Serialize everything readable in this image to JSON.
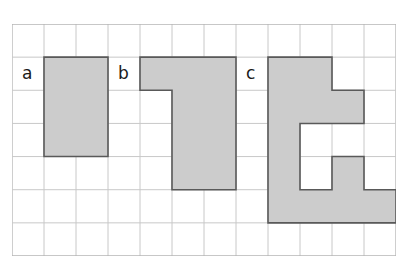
{
  "figure": {
    "type": "grid-shapes-diagram",
    "background_color": "#ffffff",
    "grid": {
      "columns": 12,
      "rows": 7,
      "cell_width": 32,
      "cell_height": 33.14,
      "origin_x": 12,
      "origin_y": 24,
      "line_color": "#c8c8c8",
      "border_color": "#b4b4b4",
      "show_grid": true
    },
    "style": {
      "shape_fill": "#cccccc",
      "shape_stroke": "#595959",
      "label_color": "#1a1a1a"
    },
    "shapes": [
      {
        "id": "shape-a",
        "label": "a",
        "label_col": 0,
        "label_row": 1,
        "cells": [
          [
            1,
            1
          ],
          [
            2,
            1
          ],
          [
            1,
            2
          ],
          [
            2,
            2
          ],
          [
            1,
            3
          ],
          [
            2,
            3
          ]
        ],
        "description": "2 by 3 rectangle, 6 squares"
      },
      {
        "id": "shape-b",
        "label": "b",
        "label_col": 3,
        "label_row": 1,
        "cells": [
          [
            4,
            1
          ],
          [
            5,
            1
          ],
          [
            6,
            1
          ],
          [
            5,
            2
          ],
          [
            6,
            2
          ],
          [
            5,
            3
          ],
          [
            6,
            3
          ],
          [
            5,
            4
          ],
          [
            6,
            4
          ]
        ],
        "description": "J shape, 9 squares"
      },
      {
        "id": "shape-c",
        "label": "c",
        "label_col": 7,
        "label_row": 1,
        "cells": [
          [
            8,
            1
          ],
          [
            9,
            1
          ],
          [
            8,
            2
          ],
          [
            9,
            2
          ],
          [
            10,
            2
          ],
          [
            8,
            3
          ],
          [
            8,
            4
          ],
          [
            10,
            4
          ],
          [
            8,
            5
          ],
          [
            9,
            5
          ],
          [
            10,
            5
          ],
          [
            11,
            5
          ]
        ],
        "description": "Irregular shape with notch, 12 squares"
      }
    ]
  }
}
